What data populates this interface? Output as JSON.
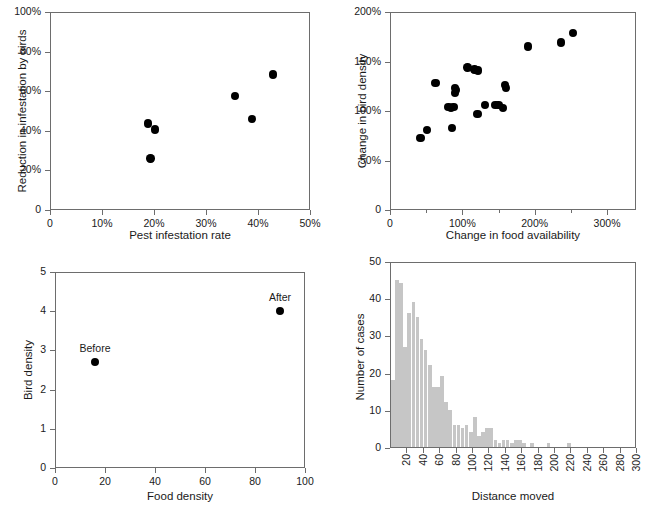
{
  "figure": {
    "panel_count": 4,
    "marker_color": "#000000",
    "bar_color": "#c6c6c6",
    "axis_color": "#6d6d6d"
  },
  "chart_data": [
    {
      "id": "panel-a",
      "type": "scatter",
      "title": "",
      "xlabel": "Pest infestation rate",
      "ylabel": "Reduction in infestation by birds",
      "xlim": [
        0,
        50
      ],
      "ylim": [
        0,
        100
      ],
      "xticks": [
        0,
        10,
        20,
        30,
        40,
        50
      ],
      "xtick_labels": [
        "0",
        "10%",
        "20%",
        "30%",
        "40%",
        "50%"
      ],
      "yticks": [
        0,
        20,
        40,
        60,
        80,
        100
      ],
      "ytick_labels": [
        "0",
        "20%",
        "40%",
        "60%",
        "80%",
        "100%"
      ],
      "grid": false,
      "legend": "none",
      "points": [
        {
          "x": 18.8,
          "y": 43.6
        },
        {
          "x": 20.2,
          "y": 40.7
        },
        {
          "x": 19.3,
          "y": 26.1
        },
        {
          "x": 35.6,
          "y": 57.7
        },
        {
          "x": 38.8,
          "y": 46.1
        },
        {
          "x": 42.9,
          "y": 68.4
        }
      ]
    },
    {
      "id": "panel-b",
      "type": "scatter",
      "title": "",
      "xlabel": "Change in food availability",
      "ylabel": "Change in bird density",
      "xlim": [
        0,
        340
      ],
      "ylim": [
        0,
        200
      ],
      "xticks": [
        0,
        100,
        200,
        300
      ],
      "xtick_labels": [
        "0",
        "100%",
        "200%",
        "300%"
      ],
      "xminor_ticks": [
        50,
        150,
        250
      ],
      "yticks": [
        0,
        50,
        100,
        150,
        200
      ],
      "ytick_labels": [
        "0",
        "50%",
        "100%",
        "150%",
        "200%"
      ],
      "grid": false,
      "legend": "none",
      "points": [
        {
          "x": 42,
          "y": 73
        },
        {
          "x": 51,
          "y": 81
        },
        {
          "x": 63,
          "y": 128
        },
        {
          "x": 81,
          "y": 104
        },
        {
          "x": 84,
          "y": 103
        },
        {
          "x": 86,
          "y": 83
        },
        {
          "x": 88,
          "y": 104
        },
        {
          "x": 90,
          "y": 118
        },
        {
          "x": 90,
          "y": 123
        },
        {
          "x": 91,
          "y": 121
        },
        {
          "x": 107,
          "y": 144
        },
        {
          "x": 117,
          "y": 142
        },
        {
          "x": 121,
          "y": 97
        },
        {
          "x": 122,
          "y": 141
        },
        {
          "x": 131,
          "y": 106
        },
        {
          "x": 146,
          "y": 106
        },
        {
          "x": 150,
          "y": 106
        },
        {
          "x": 156,
          "y": 103
        },
        {
          "x": 159,
          "y": 126
        },
        {
          "x": 160,
          "y": 123
        },
        {
          "x": 191,
          "y": 165
        },
        {
          "x": 236,
          "y": 169
        },
        {
          "x": 253,
          "y": 179
        }
      ]
    },
    {
      "id": "panel-c",
      "type": "scatter",
      "title": "",
      "xlabel": "Food density",
      "ylabel": "Bird density",
      "xlim": [
        0,
        100
      ],
      "ylim": [
        0,
        5
      ],
      "xticks": [
        0,
        20,
        40,
        60,
        80,
        100
      ],
      "xtick_labels": [
        "0",
        "20",
        "40",
        "60",
        "80",
        "100"
      ],
      "yticks": [
        0,
        1,
        2,
        3,
        4,
        5
      ],
      "ytick_labels": [
        "0",
        "1",
        "2",
        "3",
        "4",
        "5"
      ],
      "grid": false,
      "legend": "none",
      "points": [
        {
          "x": 16,
          "y": 2.7,
          "label": "Before"
        },
        {
          "x": 90,
          "y": 4.0,
          "label": "After"
        }
      ]
    },
    {
      "id": "panel-d",
      "type": "bar",
      "title": "",
      "xlabel": "Distance moved",
      "ylabel": "Number of cases",
      "xlim": [
        0,
        300
      ],
      "ylim": [
        0,
        50
      ],
      "xticks": [
        20,
        40,
        60,
        80,
        100,
        120,
        140,
        160,
        180,
        200,
        220,
        240,
        260,
        280,
        300
      ],
      "xtick_labels": [
        "20",
        "40",
        "60",
        "80",
        "100",
        "120",
        "140",
        "160",
        "180",
        "200",
        "220",
        "240",
        "260",
        "280",
        "300"
      ],
      "xtick_rotation": 90,
      "yticks": [
        0,
        10,
        20,
        30,
        40,
        50
      ],
      "ytick_labels": [
        "0",
        "10",
        "20",
        "30",
        "40",
        "50"
      ],
      "grid": false,
      "legend": "none",
      "bin_width": 5,
      "bin_starts": [
        0,
        5,
        10,
        15,
        20,
        25,
        30,
        35,
        40,
        45,
        50,
        55,
        60,
        65,
        70,
        75,
        80,
        85,
        90,
        95,
        100,
        105,
        110,
        115,
        120,
        125,
        130,
        135,
        140,
        145,
        150,
        155,
        160,
        165,
        170,
        175,
        180,
        185,
        190,
        195,
        200,
        205,
        210,
        215,
        220,
        225,
        230,
        235,
        240,
        245,
        250,
        255,
        260,
        265,
        270,
        275,
        280,
        285,
        290,
        295
      ],
      "values": [
        18,
        45,
        44,
        27,
        36,
        39,
        35,
        29,
        26,
        22,
        16,
        16,
        19,
        12,
        10,
        6,
        6,
        5,
        6,
        4,
        8,
        3,
        4,
        5,
        5,
        2,
        1,
        2,
        2,
        1,
        2,
        2,
        1,
        0,
        1,
        0,
        0,
        0,
        1,
        0,
        0,
        0,
        0,
        1,
        0,
        0,
        0,
        0,
        0,
        0,
        0,
        0,
        0,
        0,
        0,
        0,
        0,
        0,
        0,
        0
      ]
    }
  ]
}
